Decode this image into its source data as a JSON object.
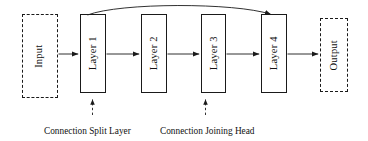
{
  "diagram": {
    "type": "block-flow-diagram",
    "background_color": "#ffffff",
    "stroke_color": "#1a1a1a",
    "text_color": "#111111",
    "nodes": [
      {
        "id": "input",
        "label": "Input",
        "border": "dashed",
        "x": 22,
        "y": 14,
        "w": 36,
        "h": 84
      },
      {
        "id": "layer1",
        "label": "Layer 1",
        "border": "solid",
        "x": 80,
        "y": 14,
        "w": 26,
        "h": 79
      },
      {
        "id": "layer2",
        "label": "Layer 2",
        "border": "solid",
        "x": 141,
        "y": 14,
        "w": 26,
        "h": 79
      },
      {
        "id": "layer3",
        "label": "Layer 3",
        "border": "solid",
        "x": 201,
        "y": 14,
        "w": 25,
        "h": 79
      },
      {
        "id": "layer4",
        "label": "Layer 4",
        "border": "solid",
        "x": 261,
        "y": 14,
        "w": 26,
        "h": 79
      },
      {
        "id": "output",
        "label": "Output",
        "border": "dashed",
        "x": 320,
        "y": 18,
        "w": 28,
        "h": 74
      }
    ],
    "flow_arrows": [
      {
        "from": "input",
        "to": "layer1"
      },
      {
        "from": "layer1",
        "to": "layer2"
      },
      {
        "from": "layer2",
        "to": "layer3"
      },
      {
        "from": "layer3",
        "to": "layer4"
      },
      {
        "from": "layer4",
        "to": "output"
      }
    ],
    "skip_connection": {
      "from": "layer1",
      "to": "layer4",
      "style": "curved-arc",
      "description": "skip connection arc from Layer 1 top to Layer 4 top"
    },
    "callouts": [
      {
        "id": "split-layer",
        "label": "Connection Split Layer",
        "points_to": "layer1",
        "text_x": 44,
        "text_y": 127
      },
      {
        "id": "joining-head",
        "label": "Connection Joining Head",
        "points_to": "layer3",
        "text_x": 160,
        "text_y": 127
      }
    ]
  }
}
